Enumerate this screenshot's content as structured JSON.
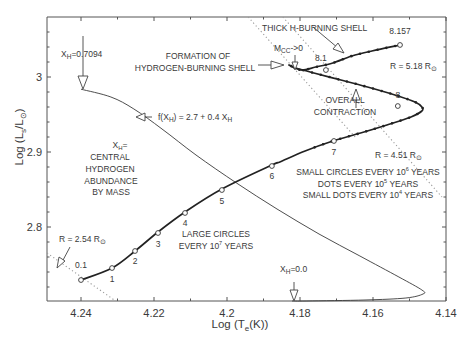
{
  "chart_data": {
    "type": "line",
    "title": "",
    "xlabel": "Log (T_e(K))",
    "ylabel": "Log (L_s/L_sun)",
    "xlim": [
      4.2493,
      4.14
    ],
    "ylim": [
      2.701,
      3.08
    ],
    "x_inverted": true,
    "grid": false,
    "x_ticks": [
      4.24,
      4.22,
      4.2,
      4.18,
      4.16,
      4.14
    ],
    "x_tick_labels": [
      "4.24",
      "4.22",
      "4.2",
      "4.18",
      "4.16",
      "4.14"
    ],
    "y_ticks": [
      2.8,
      2.9,
      3.0
    ],
    "y_tick_labels": [
      "2.8",
      "2.9",
      "3"
    ],
    "series": [
      {
        "name": "evolutionary track",
        "style": "thick",
        "x": [
          4.24,
          4.2315,
          4.2252,
          4.2189,
          4.2115,
          4.2014,
          4.1877,
          4.1855,
          4.1786,
          4.171,
          4.1634,
          4.1562,
          4.1496,
          4.1466,
          4.1466,
          4.1485,
          4.154,
          4.1615,
          4.1688,
          4.1762,
          4.1812,
          4.183,
          4.1797,
          4.1757,
          4.171,
          4.1658,
          4.1603,
          4.1526
        ],
        "y": [
          2.7293,
          2.7453,
          2.768,
          2.7933,
          2.82,
          2.8507,
          2.8827,
          2.8867,
          2.9013,
          2.9147,
          2.9253,
          2.936,
          2.9467,
          2.9547,
          2.96,
          2.9667,
          2.976,
          2.9867,
          2.996,
          3.0053,
          3.012,
          3.016,
          3.0093,
          3.0133,
          3.0187,
          3.028,
          3.0347,
          3.0427
        ]
      },
      {
        "name": "f(X_H) = 2.7 + 0.4 X_H",
        "style": "thin",
        "x": [
          4.24,
          4.2318,
          4.2255,
          4.2178,
          4.2085,
          4.1974,
          4.1863,
          4.1748,
          4.1636,
          4.1529,
          4.1466,
          4.1463,
          4.151,
          4.1622,
          4.1781,
          4.1822
        ],
        "y": [
          2.9837,
          2.9733,
          2.9573,
          2.9307,
          2.896,
          2.8587,
          2.824,
          2.7907,
          2.7613,
          2.7333,
          2.716,
          2.7107,
          2.7053,
          2.7027,
          2.7013,
          2.7013
        ]
      }
    ],
    "radius_lines": [
      {
        "label": "R=2.54 R⊙",
        "x": [
          4.2493,
          4.2305
        ],
        "y": [
          2.7653,
          2.7013
        ]
      },
      {
        "label": "R=4.51 R⊙",
        "x": [
          4.1942,
          4.1649
        ],
        "y": [
          3.08,
          2.92
        ]
      },
      {
        "label": "R=5.18 R⊙",
        "x": [
          4.1847,
          4.1411
        ],
        "y": [
          3.08,
          2.84
        ]
      }
    ],
    "large_circles_every_1e7_years": [
      {
        "label": "0.1",
        "x": 4.24,
        "y": 2.7293
      },
      {
        "label": "1",
        "x": 4.2315,
        "y": 2.7453
      },
      {
        "label": "2",
        "x": 4.2252,
        "y": 2.768
      },
      {
        "label": "3",
        "x": 4.2189,
        "y": 2.792
      },
      {
        "label": "4",
        "x": 4.2115,
        "y": 2.8187
      },
      {
        "label": "5",
        "x": 4.2014,
        "y": 2.8493
      },
      {
        "label": "6",
        "x": 4.1877,
        "y": 2.8813
      },
      {
        "label": "7",
        "x": 4.1707,
        "y": 2.9147
      },
      {
        "label": "8",
        "x": 4.1532,
        "y": 2.9613
      },
      {
        "label": "8.1",
        "x": 4.1729,
        "y": 3.0093
      },
      {
        "label": "8.157",
        "x": 4.1526,
        "y": 3.0427
      }
    ],
    "annotations": [
      {
        "text": "X_H=0.7094",
        "x": 4.24,
        "y": 2.9837
      },
      {
        "text": "FORMATION OF HYDROGEN-BURNING SHELL",
        "x": 4.183,
        "y": 3.016
      },
      {
        "text": "THICK H-BURNING SHELL",
        "x": 4.1757,
        "y": 3.036
      },
      {
        "text": "M_CC -> 0",
        "x": 4.1812,
        "y": 3.012
      },
      {
        "text": "OVERALL CONTRACTION",
        "x": 4.171,
        "y": 2.9787
      },
      {
        "text": "X_H = CENTRAL HYDROGEN ABUNDANCE BY MASS",
        "x": 4.23,
        "y": 2.86
      },
      {
        "text": "LARGE CIRCLES EVERY 10^7 YEARS",
        "x": 4.2,
        "y": 2.79
      },
      {
        "text": "SMALL CIRCLES EVERY 10^6 YEARS / DOTS EVERY 10^5 YEARS / SMALL DOTS EVERY 10^4 YEARS",
        "x": 4.16,
        "y": 2.88
      },
      {
        "text": "X_H=0.0",
        "x": 4.1822,
        "y": 2.7013
      }
    ]
  },
  "labels": {
    "xlabel_main": "Log (T",
    "xlabel_sub": "e",
    "xlabel_end": "(K))",
    "ylabel_main": "Log (L",
    "ylabel_sub1": "s",
    "ylabel_mid": "/L",
    "ylabel_sub2": "⊙",
    "ylabel_end": ")",
    "xh_start_main": "X",
    "xh_start_sub": "H",
    "xh_start_val": "=0.7094",
    "xh_end_main": "X",
    "xh_end_sub": "H",
    "xh_end_val": "=0.0",
    "formation_1": "FORMATION OF",
    "formation_2": "HYDROGEN-BURNING SHELL",
    "thick_shell": "THICK H-BURNING SHELL",
    "mcc_main": "M",
    "mcc_sub": "CC",
    "mcc_val": "->0",
    "overall_1": "OVERALL",
    "overall_2": "CONTRACTION",
    "f_main": "f(X",
    "f_sub": "H",
    "f_mid": ") = 2.7 + 0.4 X",
    "f_sub2": "H",
    "xh_def_1a": "X",
    "xh_def_1sub": "H",
    "xh_def_1b": "=",
    "xh_def_2": "CENTRAL",
    "xh_def_3": "HYDROGEN",
    "xh_def_4": "ABUNDANCE",
    "xh_def_5": "BY MASS",
    "large_1": "LARGE CIRCLES",
    "large_2a": "EVERY 10",
    "large_2sup": "7",
    "large_2b": " YEARS",
    "small_1a": "SMALL CIRCLES EVERY 10",
    "small_1sup": "6",
    "small_1b": " YEARS",
    "small_2a": "DOTS EVERY 10",
    "small_2sup": "5",
    "small_2b": " YEARS",
    "small_3a": "SMALL DOTS EVERY 10",
    "small_3sup": "4",
    "small_3b": " YEARS",
    "r254_main": "R = 2.54 R",
    "r451_main": "R = 4.51 R",
    "r518_main": "R = 5.18 R",
    "sun_sub": "⊙"
  },
  "colors": {
    "line": "#2a2a2a",
    "axis": "#555555",
    "dotted": "#9a9a9a",
    "text": "#3a3a3a"
  }
}
